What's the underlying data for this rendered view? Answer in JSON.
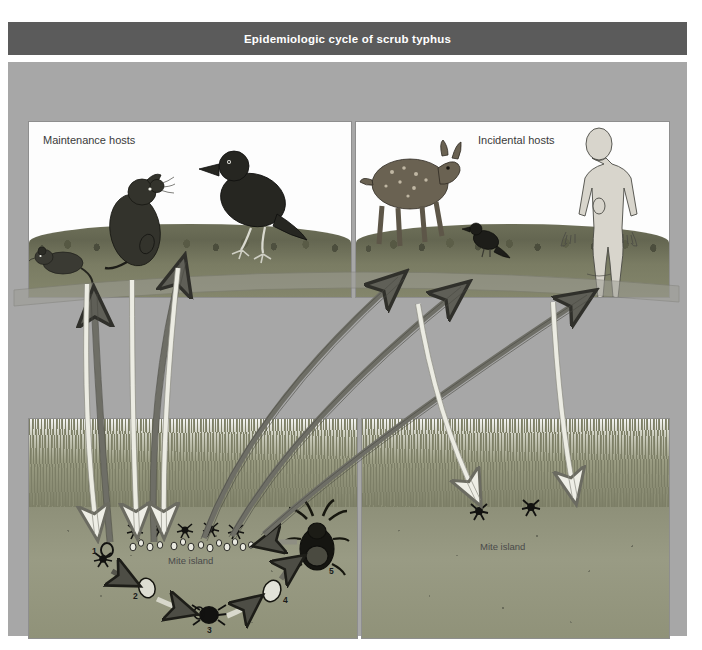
{
  "figure": {
    "title": "Epidemiologic cycle of scrub typhus",
    "title_bar_color": "#5b5b5b",
    "background_color": "#a7a7a7",
    "arrow_up_color": "#6b6b6b",
    "arrow_down_color": "#e9e9e9"
  },
  "panels": {
    "maintenance_hosts": {
      "label": "Maintenance hosts",
      "animals": [
        "rat",
        "mouse",
        "bird"
      ]
    },
    "incidental_hosts": {
      "label": "Incidental hosts",
      "animals": [
        "deer",
        "bird",
        "human"
      ]
    },
    "mite_island_left": {
      "label": "Mite island",
      "larvae_count": 5,
      "egg_count": 14
    },
    "mite_island_right": {
      "label": "Mite island",
      "larvae_count": 2
    }
  },
  "life_cycle": {
    "stages": [
      {
        "num": "1",
        "name": "larva-questing"
      },
      {
        "num": "2",
        "name": "nymphochrysalis"
      },
      {
        "num": "3",
        "name": "nymph"
      },
      {
        "num": "4",
        "name": "imagochrysalis"
      },
      {
        "num": "5",
        "name": "adult-mite"
      }
    ]
  }
}
